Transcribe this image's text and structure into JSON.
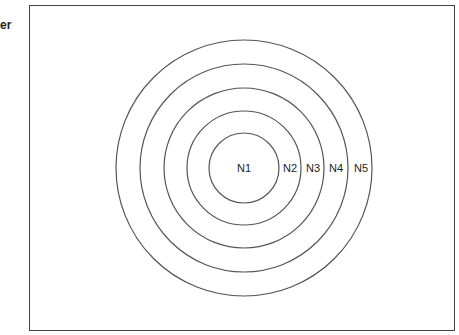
{
  "side_label": "er",
  "diagram": {
    "center": {
      "x": 244,
      "y": 168
    },
    "circles": [
      {
        "name": "N1",
        "radius": 35,
        "label_x": 244
      },
      {
        "name": "N2",
        "radius": 57,
        "label_x": 290
      },
      {
        "name": "N3",
        "radius": 80,
        "label_x": 313
      },
      {
        "name": "N4",
        "radius": 104,
        "label_x": 336
      },
      {
        "name": "N5",
        "radius": 128,
        "label_x": 361
      }
    ],
    "stroke_color": "#555555"
  }
}
